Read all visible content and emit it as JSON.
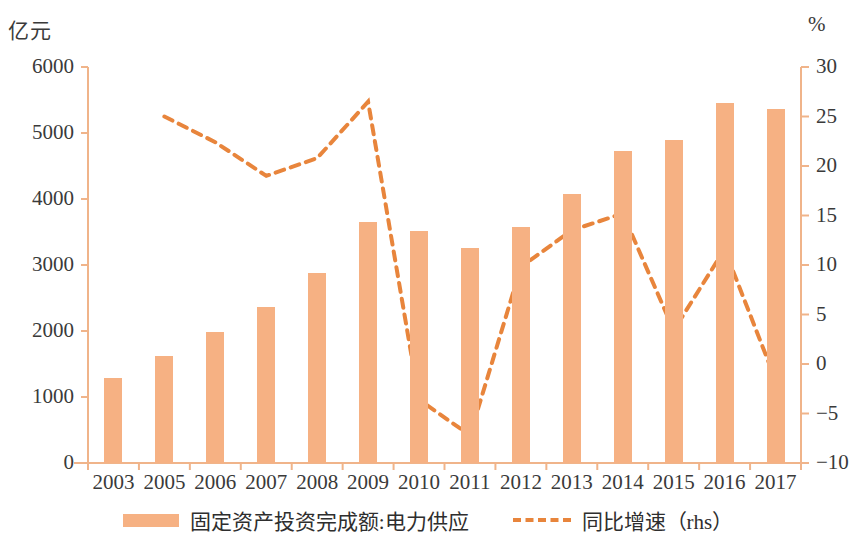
{
  "axes": {
    "left_unit": "亿元",
    "right_unit": "%",
    "left_ticks": [
      "6000",
      "5000",
      "4000",
      "3000",
      "2000",
      "1000",
      "0"
    ],
    "right_ticks": [
      "30",
      "25",
      "20",
      "15",
      "10",
      "5",
      "0",
      "−5",
      "−10"
    ]
  },
  "legend": {
    "bar_label": "固定资产投资完成额:电力供应",
    "line_label": "同比增速（rhs）",
    "bar_color": "#f6b183",
    "line_color": "#e8853c"
  },
  "chart_data": {
    "type": "bar",
    "title": "",
    "xlabel": "",
    "ylabel": "亿元",
    "y2label": "%",
    "ylim": [
      0,
      6000
    ],
    "y2lim": [
      -10,
      30
    ],
    "grid": false,
    "legend_position": "bottom",
    "categories": [
      "2003",
      "2005",
      "2006",
      "2007",
      "2008",
      "2009",
      "2010",
      "2011",
      "2012",
      "2013",
      "2014",
      "2015",
      "2016",
      "2017"
    ],
    "series": [
      {
        "name": "固定资产投资完成额:电力供应",
        "type": "bar",
        "axis": "left",
        "unit": "亿元",
        "color": "#f6b183",
        "values": [
          1290,
          1620,
          1990,
          2360,
          2880,
          3650,
          3520,
          3260,
          3570,
          4080,
          4720,
          4890,
          5460,
          5370
        ]
      },
      {
        "name": "同比增速（rhs）",
        "type": "line",
        "axis": "right",
        "unit": "%",
        "color": "#e8853c",
        "style": "dashed",
        "values": [
          null,
          25.0,
          22.4,
          19.0,
          20.8,
          26.5,
          -3.6,
          -7.2,
          9.8,
          13.5,
          15.2,
          3.4,
          11.6,
          -1.6
        ]
      }
    ]
  }
}
